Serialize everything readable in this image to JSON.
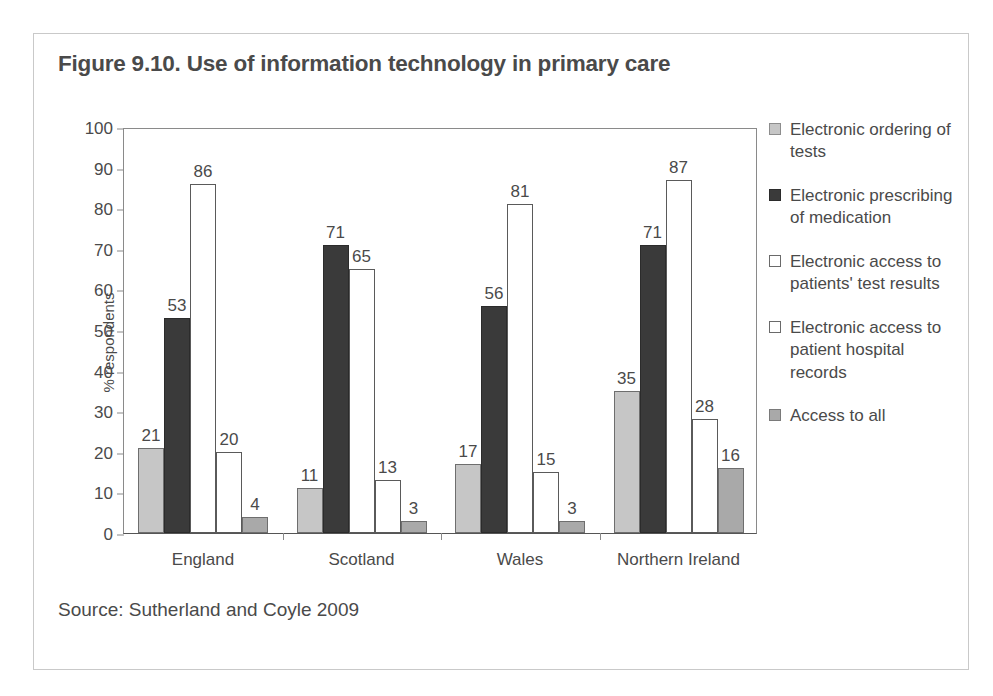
{
  "figure": {
    "title": "Figure 9.10. Use of information technology in primary care",
    "source": "Source: Sutherland and Coyle 2009"
  },
  "chart_data": {
    "type": "bar",
    "title": "Figure 9.10. Use of information technology in primary care",
    "xlabel": "",
    "ylabel": "% respondents",
    "ylim": [
      0,
      100
    ],
    "yticks": [
      0,
      10,
      20,
      30,
      40,
      50,
      60,
      70,
      80,
      90,
      100
    ],
    "grid": false,
    "legend_position": "right",
    "categories": [
      "England",
      "Scotland",
      "Wales",
      "Northern Ireland"
    ],
    "series": [
      {
        "name": "Electronic ordering of tests",
        "color": "#c6c6c6",
        "values": [
          21,
          11,
          17,
          35
        ]
      },
      {
        "name": "Electronic prescribing of medication",
        "color": "#3a3a3a",
        "values": [
          53,
          71,
          56,
          71
        ]
      },
      {
        "name": "Electronic access to patients' test results",
        "color": "#ffffff",
        "values": [
          86,
          65,
          81,
          87
        ]
      },
      {
        "name": "Electronic access to patient hospital records",
        "color": "#ffffff",
        "values": [
          20,
          13,
          15,
          28
        ]
      },
      {
        "name": "Access to all",
        "color": "#a9a9a9",
        "values": [
          4,
          3,
          3,
          16
        ]
      }
    ],
    "annotations": [
      "Source: Sutherland and Coyle 2009"
    ]
  }
}
